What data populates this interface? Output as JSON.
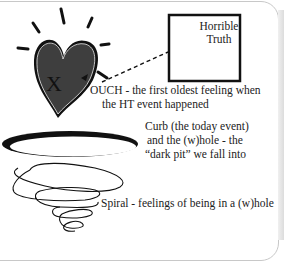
{
  "diagram": {
    "box": {
      "line1": "Horrible",
      "line2": "Truth"
    },
    "heart": {
      "mark": "X",
      "color": "#3a3a3a"
    },
    "ouch": {
      "line1": "OUCH - the first oldest feeling when",
      "line2": "the HT event happened"
    },
    "curb": {
      "line1": "Curb (the today event)",
      "line2": "and the (w)hole - the",
      "line3": "“dark pit” we fall into"
    },
    "spiral": {
      "label": "Spiral - feelings of being in a (w)hole"
    }
  }
}
